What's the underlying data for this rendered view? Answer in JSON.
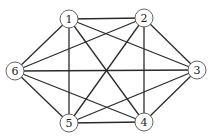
{
  "diagram": {
    "type": "graph",
    "directed": false,
    "nodes": [
      {
        "id": "1",
        "label": "1",
        "x": 69,
        "y": 19
      },
      {
        "id": "2",
        "label": "2",
        "x": 144,
        "y": 18
      },
      {
        "id": "3",
        "label": "3",
        "x": 197,
        "y": 70
      },
      {
        "id": "4",
        "label": "4",
        "x": 144,
        "y": 122
      },
      {
        "id": "5",
        "label": "5",
        "x": 69,
        "y": 123
      },
      {
        "id": "6",
        "label": "6",
        "x": 15,
        "y": 71
      }
    ],
    "edges": [
      [
        "1",
        "2"
      ],
      [
        "1",
        "3"
      ],
      [
        "1",
        "4"
      ],
      [
        "1",
        "5"
      ],
      [
        "1",
        "6"
      ],
      [
        "2",
        "3"
      ],
      [
        "2",
        "4"
      ],
      [
        "2",
        "5"
      ],
      [
        "2",
        "6"
      ],
      [
        "3",
        "4"
      ],
      [
        "3",
        "5"
      ],
      [
        "3",
        "6"
      ],
      [
        "4",
        "5"
      ],
      [
        "4",
        "6"
      ],
      [
        "5",
        "6"
      ]
    ],
    "node_radius": 9,
    "colors": {
      "edge": "#2b2b2b",
      "node_stroke": "#555555",
      "node_fill": "#ffffff",
      "label": "#222222"
    }
  }
}
